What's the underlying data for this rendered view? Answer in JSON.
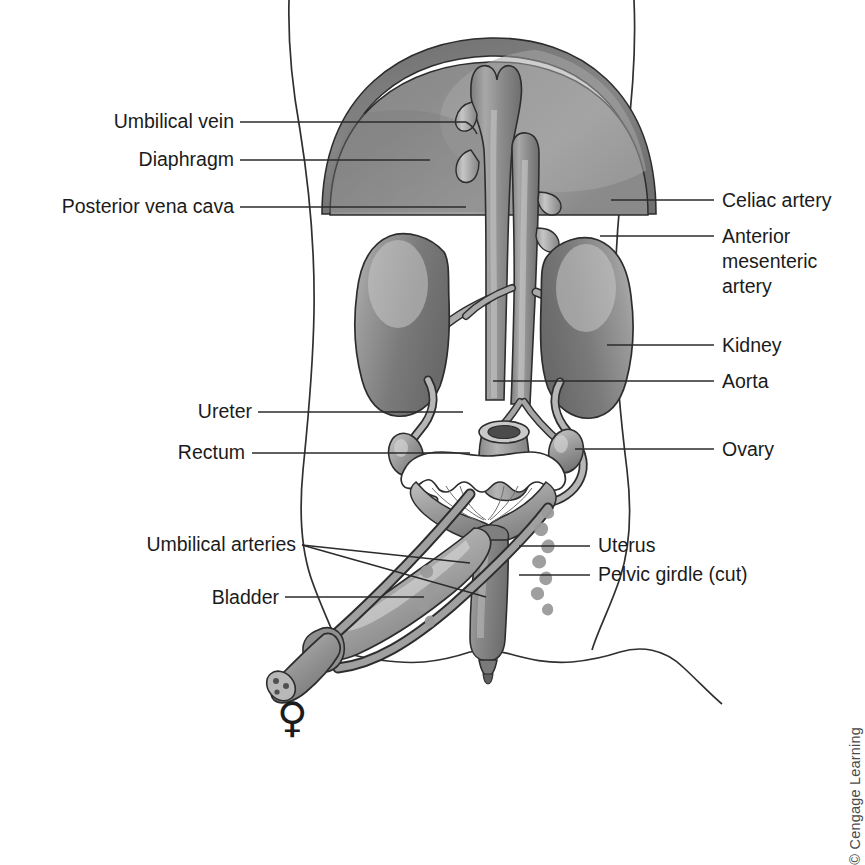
{
  "figure": {
    "sex_symbol": "♀",
    "credit": "© Cengage Learning"
  },
  "labels_left": [
    {
      "id": "umbilical-vein",
      "text": "Umbilical vein",
      "text_x": 234,
      "text_y": 128,
      "line": "240,122 L 466,122"
    },
    {
      "id": "diaphragm",
      "text": "Diaphragm",
      "text_x": 234,
      "text_y": 166,
      "line": "240,160 L 430,160"
    },
    {
      "id": "posterior-vena-cava",
      "text": "Posterior vena cava",
      "text_x": 234,
      "text_y": 213,
      "line": "240,207 L 466,207"
    },
    {
      "id": "ureter",
      "text": "Ureter",
      "text_x": 252,
      "text_y": 418,
      "line": "258,412 L 463,412"
    },
    {
      "id": "rectum",
      "text": "Rectum",
      "text_x": 243,
      "text_y": 459,
      "line": "252,453 L 470,453"
    },
    {
      "id": "umbilical-arteries",
      "text": "Umbilical arteries",
      "text_x": 134,
      "text_y": 551,
      "line": "302,545 L 470,563"
    },
    {
      "id": "umbilical-arteries-2",
      "text": "",
      "text_x": 0,
      "text_y": 0,
      "line": "302,545 L 486,597"
    },
    {
      "id": "bladder",
      "text": "Bladder",
      "text_x": 206,
      "text_y": 604,
      "line": "285,597 L 424,597"
    }
  ],
  "labels_right": [
    {
      "id": "celiac-artery",
      "text": "Celiac artery",
      "text_x": 722,
      "text_y": 207,
      "line": "611,200 L 714,200"
    },
    {
      "id": "anterior-mesenteric-artery",
      "text": "Anterior",
      "text_x": 722,
      "text_y": 243,
      "line": "600,236 L 714,236"
    },
    {
      "id": "anterior-mesenteric-artery-l2",
      "text": "mesenteric",
      "text_x": 722,
      "text_y": 268,
      "line": ""
    },
    {
      "id": "anterior-mesenteric-artery-l3",
      "text": "artery",
      "text_x": 722,
      "text_y": 293,
      "line": ""
    },
    {
      "id": "kidney",
      "text": "Kidney",
      "text_x": 722,
      "text_y": 352,
      "line": "607,345 L 714,345"
    },
    {
      "id": "aorta",
      "text": "Aorta",
      "text_x": 722,
      "text_y": 388,
      "line": "493,381 L 714,381"
    },
    {
      "id": "ovary",
      "text": "Ovary",
      "text_x": 722,
      "text_y": 456,
      "line": "575,449 L 714,449"
    },
    {
      "id": "uterus",
      "text": "Uterus",
      "text_x": 598,
      "text_y": 552,
      "line": "519,546 L 590,546"
    },
    {
      "id": "pelvic-girdle",
      "text": "Pelvic girdle (cut)",
      "text_x": 598,
      "text_y": 581,
      "line": "519,575 L 590,575"
    }
  ],
  "organs": [
    {
      "id": "diaphragm",
      "name": "Diaphragm",
      "fill": "#8e8e8e"
    },
    {
      "id": "posterior-vena-cava",
      "name": "Posterior vena cava",
      "fill": "#8a8a8a"
    },
    {
      "id": "aorta",
      "name": "Aorta",
      "fill": "#9a9a9a"
    },
    {
      "id": "kidney-left",
      "name": "Kidney",
      "fill": "#8d8d8d"
    },
    {
      "id": "kidney-right",
      "name": "Kidney",
      "fill": "#8d8d8d"
    },
    {
      "id": "ureter-left",
      "name": "Ureter",
      "fill": "#b0b0b0"
    },
    {
      "id": "ureter-right",
      "name": "Ureter",
      "fill": "#b0b0b0"
    },
    {
      "id": "ovary-left",
      "name": "Ovary",
      "fill": "#9d9d9d"
    },
    {
      "id": "ovary-right",
      "name": "Ovary",
      "fill": "#9d9d9d"
    },
    {
      "id": "uterine-horns",
      "name": "Uterine horns",
      "fill": "#a6a6a6"
    },
    {
      "id": "uterus-body",
      "name": "Uterus",
      "fill": "#8f8f8f"
    },
    {
      "id": "bladder",
      "name": "Urinary bladder",
      "fill": "#9e9e9e"
    },
    {
      "id": "umbilical-artery-1",
      "name": "Umbilical artery",
      "fill": "#8b8b8b"
    },
    {
      "id": "umbilical-artery-2",
      "name": "Umbilical artery",
      "fill": "#8b8b8b"
    },
    {
      "id": "umbilical-cord",
      "name": "Umbilical cord stump",
      "fill": "#9c9c9c"
    },
    {
      "id": "rectum",
      "name": "Rectum",
      "fill": "#9b9b9b"
    },
    {
      "id": "pelvic-girdle",
      "name": "Pelvic girdle (cut)",
      "fill": "#9a9a9a"
    }
  ],
  "colors": {
    "outline": "#303030",
    "organ_mid": "#8f8f8f",
    "organ_dark": "#6d6d6d",
    "organ_light": "#c4c4c4",
    "background": "#ffffff",
    "text": "#1b1b1b",
    "credit_text": "#4a4a4a"
  }
}
